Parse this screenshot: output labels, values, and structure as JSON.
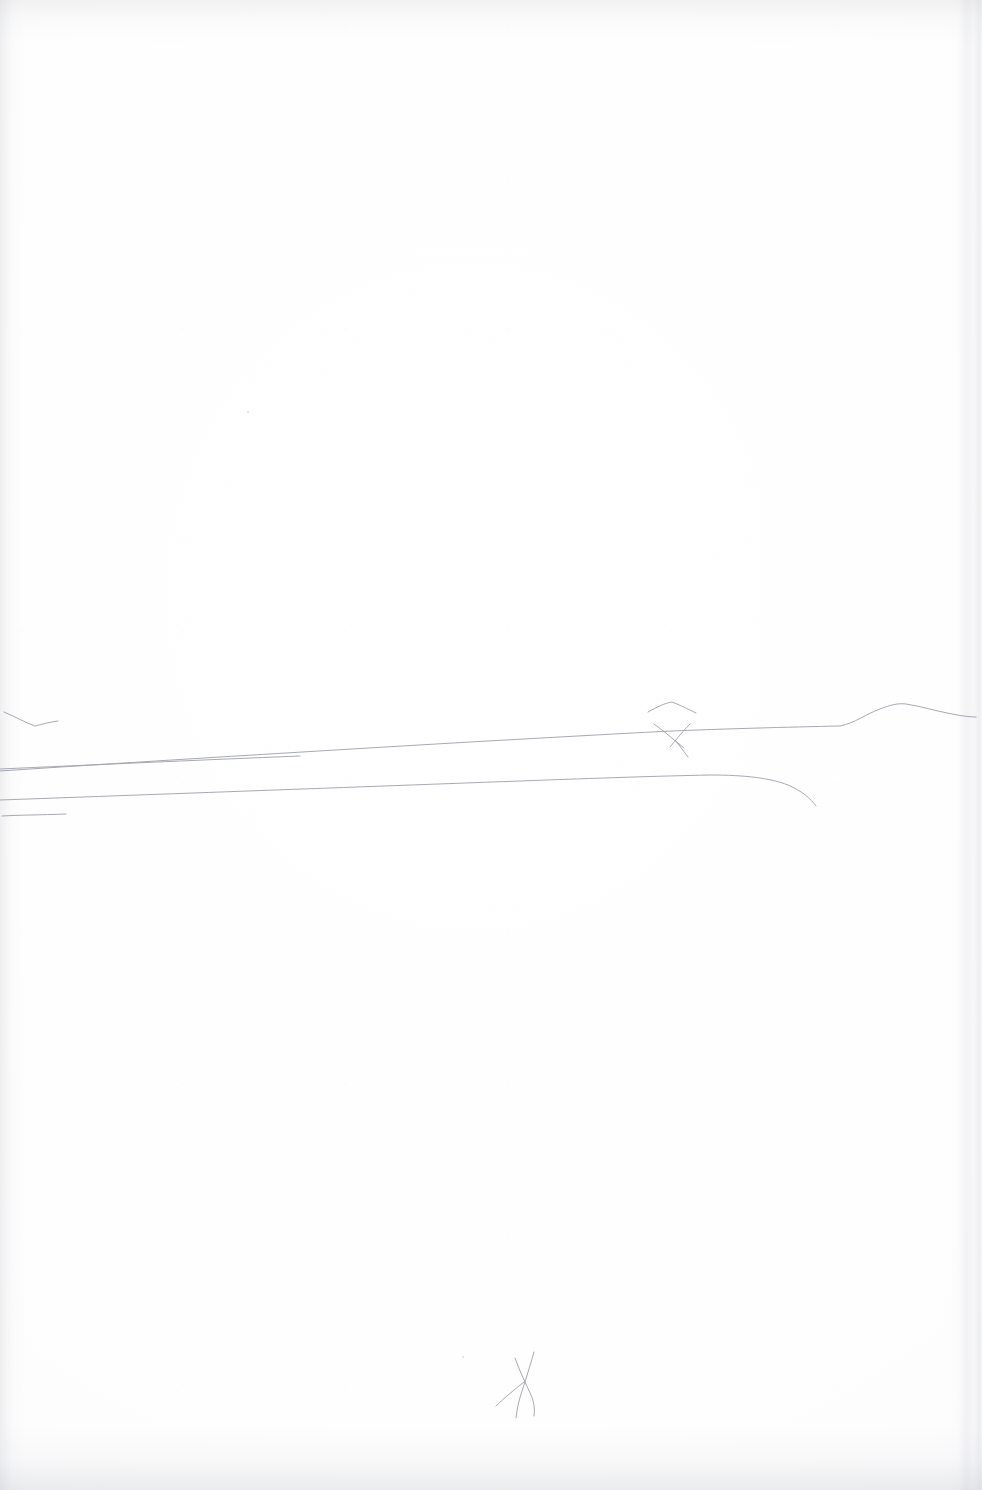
{
  "document": {
    "kind": "scanned-paper-sheet",
    "title": "Blank sheet with faint pencil landscape sketch",
    "medium": "graphite pencil on white paper",
    "orientation": "portrait",
    "width_px": 982,
    "height_px": 1490,
    "visible_text": "",
    "paper_color": "#ffffff",
    "paper_tone_shadow": "#fafafb",
    "pencil_color": "#9ea2ab",
    "pencil_color_dark": "#8c909a"
  },
  "sketch": {
    "description": "Very faint minimal pencil landscape: long near-horizontal horizon lines crossing the page, a low hill at the right, a small peak and an X crossing near centre-right, and a small squiggly mark low on the page.",
    "stroke_color": "#9ea2ab",
    "stroke_width": 1.0,
    "strokes": [
      {
        "name": "check-mark-left",
        "note": "small shallow V / tick at far left above the horizon",
        "path": "M 4 712 C 16 717, 26 723, 35 726 C 43 724, 50 722, 58 721"
      },
      {
        "name": "small-peak-arc",
        "note": "short arc peak above the X crossing",
        "path": "M 648 712 C 657 707, 665 703, 672 702 C 680 705, 688 709, 696 713"
      },
      {
        "name": "horizon-main",
        "note": "long main horizon line sloping gently up to the right, rising over a hill at far right",
        "path": "M 0 771 C 120 763, 300 752, 470 742 C 560 737, 630 733, 672 731 C 720 729, 790 727, 840 726 C 855 723, 866 714, 880 709 C 890 705, 898 703, 906 704 C 920 706, 936 711, 952 714 C 962 716, 970 717, 976 717"
      },
      {
        "name": "x-branch-upper",
        "note": "short stroke of the X, going down-right across the horizon",
        "path": "M 654 724 C 664 731, 674 740, 684 748"
      },
      {
        "name": "x-branch-lower",
        "note": "second short stroke of the X, crossing the first",
        "path": "M 690 724 C 682 732, 676 740, 670 747"
      },
      {
        "name": "x-tail",
        "note": "small tail descending from the X crossing",
        "path": "M 676 741 C 680 746, 684 752, 688 757"
      },
      {
        "name": "horizon-second",
        "note": "second long line below the main one, curving downward at its right end",
        "path": "M 0 800 C 140 795, 330 788, 520 781 C 600 778, 660 776, 710 775 C 745 775, 770 778, 788 785 C 802 791, 810 798, 816 806"
      },
      {
        "name": "line-upper-left-short",
        "note": "shorter line at the left starting at the edge, running right and fading",
        "path": "M 0 769 C 90 765, 200 760, 300 756"
      },
      {
        "name": "stub-bottom-left",
        "note": "short stub line at the lower left",
        "path": "M 2 816 C 18 815, 40 815, 66 814"
      },
      {
        "name": "squiggle-mark",
        "note": "small loose X/scribble mark low on the page",
        "path": "M 534 1352 C 530 1366, 526 1379, 522 1391 C 519 1400, 517 1409, 516 1418"
      },
      {
        "name": "squiggle-mark-2",
        "note": "crossing stroke of the low scribble",
        "path": "M 515 1358 C 520 1372, 526 1384, 531 1395 C 534 1402, 535 1409, 534 1416"
      },
      {
        "name": "squiggle-tail",
        "note": "tail of the low scribble sweeping down-left",
        "path": "M 524 1382 C 514 1390, 504 1398, 496 1406"
      }
    ],
    "specks": [
      {
        "name": "speck-upper-mid",
        "x": 248,
        "y": 412,
        "r": 1.1
      },
      {
        "name": "speck-lower-mid",
        "x": 463,
        "y": 1357,
        "r": 1.0
      }
    ]
  }
}
